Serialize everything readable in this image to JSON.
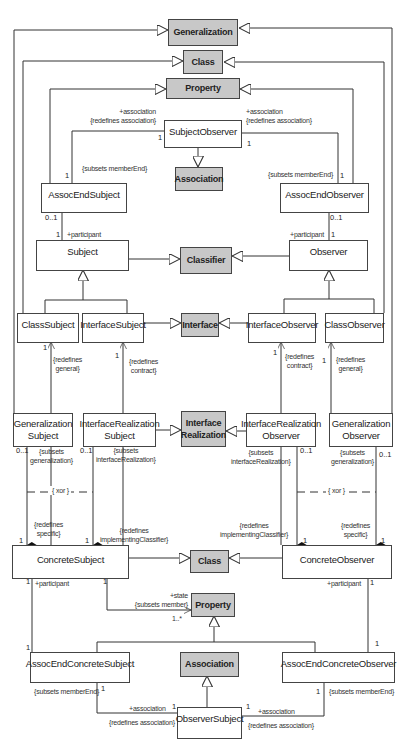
{
  "diagram": {
    "classes": {
      "generalization": "Generalization",
      "class_top": "Class",
      "property_top": "Property",
      "subject_observer": "SubjectObserver",
      "association_top": "Association",
      "assoc_end_subject": "AssocEndSubject",
      "assoc_end_observer": "AssocEndObserver",
      "subject": "Subject",
      "classifier": "Classifier",
      "observer": "Observer",
      "class_subject": "ClassSubject",
      "interface_subject": "InterfaceSubject",
      "interface": "Interface",
      "interface_observer": "InterfaceObserver",
      "class_observer": "ClassObserver",
      "generalization_subject": "Generalization\nSubject",
      "interface_realization_subject": "InterfaceRealization\nSubject",
      "interface_realization": "Interface\nRealization",
      "interface_realization_observer": "InterfaceRealization\nObserver",
      "generalization_observer": "Generalization\nObserver",
      "concrete_subject": "ConcreteSubject",
      "class_mid": "Class",
      "concrete_observer": "ConcreteObserver",
      "property_bottom": "Property",
      "assoc_end_concrete_subject": "AssocEndConcreteSubject",
      "association_bottom": "Association",
      "assoc_end_concrete_observer": "AssocEndConcreteObserver",
      "observer_subject": "ObserverSubject"
    },
    "labels": {
      "assoc_left_top": "+association\n{redefines association}",
      "assoc_right_top": "+association\n{redefines association}",
      "subsets_member_end_left": "{subsets memberEnd}",
      "subsets_member_end_right": "{subsets memberEnd}",
      "participant_left": "+participant",
      "participant_right": "+participant",
      "redefines_general_left": "{redefines\ngeneral}",
      "redefines_contract_left": "{redefines\ncontract}",
      "redefines_contract_right": "{redefines\ncontract}",
      "redefines_general_right": "{redefines\ngeneral}",
      "subsets_generalization_left": "{subsets\ngeneralization}",
      "subsets_interface_realization_left": "{subsets\ninterfaceRealization}",
      "subsets_interface_realization_right": "{subsets\ninterfaceRealization}",
      "subsets_generalization_right": "{subsets\ngeneralization}",
      "xor_left": "{ xor }",
      "xor_right": "{ xor }",
      "redefines_specific_left": "{redefines\nspecific}",
      "redefines_impl_left": "{redefines\nimplementingClassifier}",
      "redefines_impl_right": "{redefines\nimplementingClassifier}",
      "redefines_specific_right": "{redefines\nspecific}",
      "participant_bottom_left": "+participant",
      "participant_bottom_right": "+participant",
      "state": "+state\n{subsets member}",
      "state_mult": "1..*",
      "subsets_member_end_bottom_left": "{subsets memberEnd}",
      "subsets_member_end_bottom_right": "{subsets memberEnd}",
      "assoc_bottom_left_role": "+association",
      "assoc_bottom_left_constraint": "{redefines association}",
      "assoc_bottom_right_role": "+association",
      "assoc_bottom_right_constraint": "{redefines association}"
    },
    "multiplicities": {
      "one": "1",
      "zero_one": "0..1"
    },
    "colors": {
      "metaclass_fill": "#c8c8c8",
      "box_border": "#444444",
      "line": "#333333"
    }
  }
}
